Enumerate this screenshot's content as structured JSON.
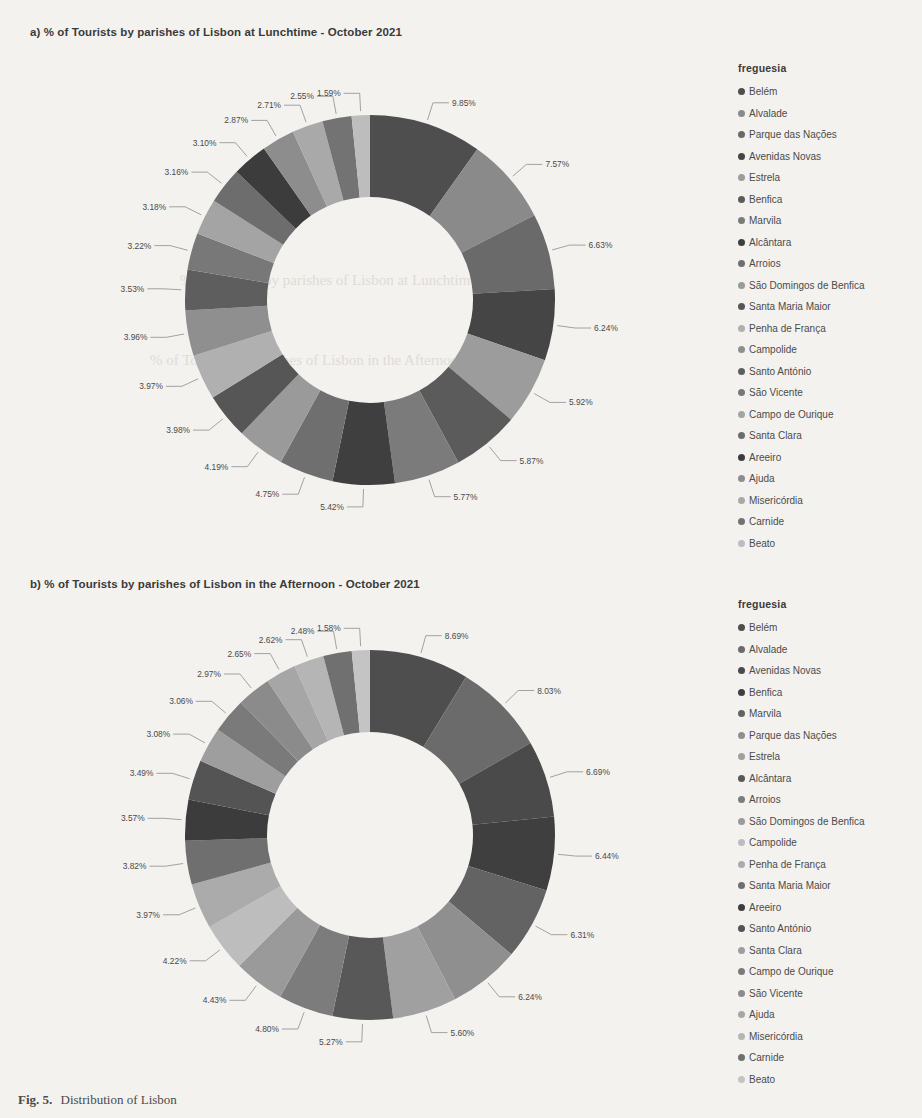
{
  "charts": [
    {
      "id": "lunchtime",
      "title": "a) % of Tourists by parishes of Lisbon at Lunchtime - October 2021",
      "legend_title": "freguesia",
      "chart_data": {
        "type": "pie",
        "variant": "donut",
        "title": "a) % of Tourists by parishes of Lisbon at Lunchtime - October 2021",
        "legend_position": "right",
        "legend_title": "freguesia",
        "units": "percent",
        "categories": [
          "Belém",
          "Alvalade",
          "Parque das Nações",
          "Avenidas Novas",
          "Estrela",
          "Benfica",
          "Marvila",
          "Alcântara",
          "Arroios",
          "São Domingos de Benfica",
          "Santa Maria Maior",
          "Penha de França",
          "Campolide",
          "Santo António",
          "São Vicente",
          "Campo de Ourique",
          "Santa Clara",
          "Areeiro",
          "Ajuda",
          "Misericórdia",
          "Carnide",
          "Beato"
        ],
        "values": [
          9.85,
          7.57,
          6.63,
          6.24,
          5.92,
          5.87,
          5.77,
          5.42,
          4.75,
          4.19,
          3.98,
          3.97,
          3.96,
          3.53,
          3.22,
          3.18,
          3.16,
          3.1,
          2.87,
          2.71,
          2.55,
          1.59
        ],
        "labels": [
          "9.85%",
          "7.57%",
          "6.63%",
          "6.24%",
          "5.92%",
          "5.87%",
          "5.77%",
          "5.42%",
          "4.75%",
          "4.19%",
          "3.98%",
          "3.97%",
          "3.96%",
          "3.53%",
          "3.22%",
          "3.18%",
          "3.16%",
          "3.10%",
          "2.87%",
          "2.71%",
          "2.55%",
          "1.59%"
        ],
        "colors": [
          "#4e4e4e",
          "#8a8a8a",
          "#6a6a6a",
          "#454545",
          "#9c9c9c",
          "#5b5b5b",
          "#7b7b7b",
          "#3f3f3f",
          "#6f6f6f",
          "#9a9a9a",
          "#565656",
          "#b0b0b0",
          "#8f8f8f",
          "#5e5e5e",
          "#787878",
          "#a4a4a4",
          "#6d6d6d",
          "#3c3c3c",
          "#8d8d8d",
          "#a9a9a9",
          "#737373",
          "#bdbdbd"
        ]
      }
    },
    {
      "id": "afternoon",
      "title": "b) % of Tourists by parishes of Lisbon in the Afternoon - October 2021",
      "legend_title": "freguesia",
      "chart_data": {
        "type": "pie",
        "variant": "donut",
        "title": "b) % of Tourists by parishes of Lisbon in the Afternoon - October 2021",
        "legend_position": "right",
        "legend_title": "freguesia",
        "units": "percent",
        "categories": [
          "Belém",
          "Alvalade",
          "Avenidas Novas",
          "Benfica",
          "Marvila",
          "Parque das Nações",
          "Estrela",
          "Alcântara",
          "Arroios",
          "São Domingos de Benfica",
          "Campolide",
          "Penha de França",
          "Santa Maria Maior",
          "Areeiro",
          "Santo António",
          "Santa Clara",
          "Campo de Ourique",
          "São Vicente",
          "Ajuda",
          "Misericórdia",
          "Carnide",
          "Beato"
        ],
        "values": [
          8.69,
          8.03,
          6.69,
          6.44,
          6.31,
          6.24,
          5.6,
          5.27,
          4.8,
          4.43,
          4.22,
          3.97,
          3.82,
          3.57,
          3.49,
          3.08,
          3.06,
          2.97,
          2.65,
          2.62,
          2.48,
          1.58
        ],
        "labels": [
          "8.69%",
          "8.03%",
          "6.69%",
          "6.44%",
          "6.31%",
          "6.24%",
          "5.60%",
          "5.27%",
          "4.80%",
          "4.43%",
          "4.22%",
          "3.97%",
          "3.82%",
          "3.57%",
          "3.49%",
          "3.08%",
          "3.06%",
          "2.97%",
          "2.65%",
          "2.62%",
          "2.48%",
          "1.58%"
        ],
        "colors": [
          "#4e4e4e",
          "#6b6b6b",
          "#4a4a4a",
          "#3f3f3f",
          "#636363",
          "#8f8f8f",
          "#a0a0a0",
          "#585858",
          "#7c7c7c",
          "#9a9a9a",
          "#bdbdbd",
          "#ababab",
          "#6f6f6f",
          "#3c3c3c",
          "#545454",
          "#9e9e9e",
          "#7a7a7a",
          "#8b8b8b",
          "#a6a6a6",
          "#b5b5b5",
          "#707070",
          "#c4c4c4"
        ]
      }
    }
  ],
  "figure_caption": {
    "number": "Fig. 5.",
    "text": "Distribution of Lisbon"
  },
  "ghost_text": [
    "% of Tourists by parishes of Lisbon at Lunchtime",
    "% of Tourists by parishes of Lisbon in the Afternoon"
  ]
}
